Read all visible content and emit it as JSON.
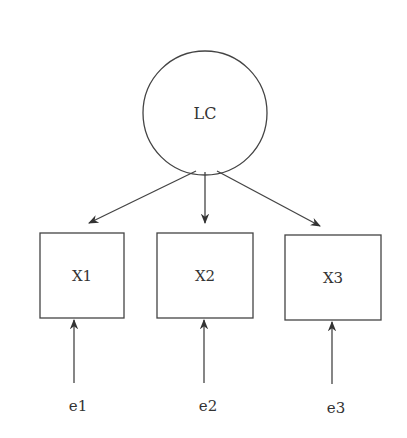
{
  "diagram": {
    "type": "measurement-model",
    "stroke_color": "#444444",
    "latent": {
      "id": "LC",
      "label": "LC",
      "cx": 205,
      "cy": 113,
      "r": 62
    },
    "indicators": [
      {
        "id": "X1",
        "label": "X1",
        "x": 40,
        "y": 233,
        "w": 84,
        "h": 85
      },
      {
        "id": "X2",
        "label": "X2",
        "x": 157,
        "y": 233,
        "w": 96,
        "h": 85
      },
      {
        "id": "X3",
        "label": "X3",
        "x": 285,
        "y": 235,
        "w": 96,
        "h": 85
      }
    ],
    "errors": [
      {
        "id": "e1",
        "label": "e1",
        "x": 74,
        "y": 405
      },
      {
        "id": "e2",
        "label": "e2",
        "x": 204,
        "y": 405
      },
      {
        "id": "e3",
        "label": "e3",
        "x": 332,
        "y": 407
      }
    ],
    "edges": [
      {
        "from": "LC",
        "to": "X1"
      },
      {
        "from": "LC",
        "to": "X2"
      },
      {
        "from": "LC",
        "to": "X3"
      },
      {
        "from": "e1",
        "to": "X1"
      },
      {
        "from": "e2",
        "to": "X2"
      },
      {
        "from": "e3",
        "to": "X3"
      }
    ]
  }
}
